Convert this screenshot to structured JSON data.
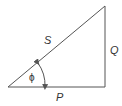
{
  "diagram": {
    "type": "right-triangle",
    "labels": {
      "hypotenuse": "S",
      "vertical_side": "Q",
      "base": "P",
      "angle": "ϕ"
    },
    "colors": {
      "stroke": "#555555",
      "text": "#333333"
    }
  }
}
